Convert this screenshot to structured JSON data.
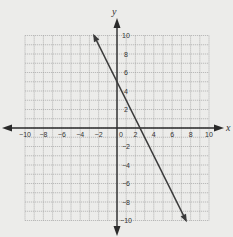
{
  "chart_data": {
    "type": "line",
    "title": "",
    "xlabel": "x",
    "ylabel": "y",
    "xlim": [
      -10,
      10
    ],
    "ylim": [
      -10,
      10
    ],
    "grid": true,
    "grid_minor_step": 1,
    "x_tick_labels": [
      "-10",
      "-8",
      "-6",
      "-4",
      "-2",
      "0",
      "2",
      "4",
      "6",
      "8",
      "10"
    ],
    "y_tick_labels": [
      "10",
      "8",
      "6",
      "4",
      "2",
      "-2",
      "-4",
      "-6",
      "-8",
      "-10"
    ],
    "series": [
      {
        "name": "line",
        "equation": "y = -2x + 5",
        "slope": -2,
        "intercept": 5,
        "x": [
          -2.5,
          7.5
        ],
        "y": [
          10,
          -10
        ],
        "arrows": "both"
      }
    ],
    "key_points": [
      {
        "x": 0,
        "y": 5,
        "label": "y-intercept"
      },
      {
        "x": 2.5,
        "y": 0,
        "label": "x-intercept"
      }
    ]
  },
  "labels": {
    "x_axis": "x",
    "y_axis": "y",
    "origin": "0"
  },
  "colors": {
    "background": "#ececea",
    "grid": "#9a9a9a",
    "axis": "#2a2a2a",
    "line": "#3a3a3a",
    "text": "#333333"
  }
}
